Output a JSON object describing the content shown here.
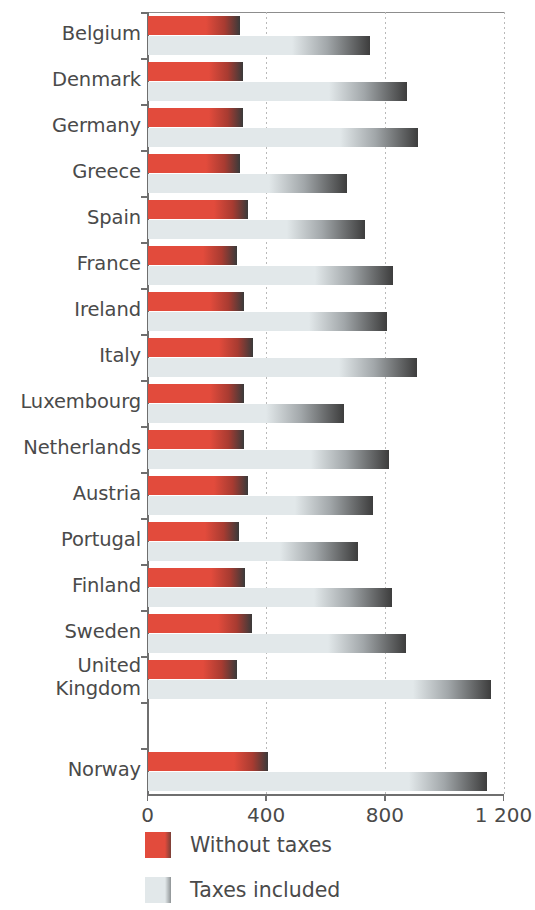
{
  "chart_data": {
    "type": "bar",
    "orientation": "horizontal",
    "title": "",
    "xlabel": "",
    "ylabel": "",
    "xlim": [
      0,
      1200
    ],
    "xticks": [
      0,
      400,
      800,
      1200
    ],
    "xtick_labels": [
      "0",
      "400",
      "800",
      "1 200"
    ],
    "grid": "vertical-dotted",
    "legend_position": "bottom-left",
    "categories": [
      "Belgium",
      "Denmark",
      "Germany",
      "Greece",
      "Spain",
      "France",
      "Ireland",
      "Italy",
      "Luxembourg",
      "Netherlands",
      "Austria",
      "Portugal",
      "Finland",
      "Sweden",
      "United\nKingdom",
      "",
      "Norway"
    ],
    "series": [
      {
        "name": "Without taxes",
        "color": "#e24b3c",
        "values": [
          311,
          321,
          321,
          311,
          338,
          301,
          324,
          354,
          324,
          324,
          338,
          308,
          328,
          351,
          301,
          null,
          406
        ]
      },
      {
        "name": "Taxes included",
        "color": "#e2e8ea",
        "values": [
          750,
          876,
          913,
          672,
          733,
          828,
          807,
          909,
          663,
          815,
          760,
          711,
          824,
          872,
          1159,
          null,
          1146
        ]
      }
    ]
  },
  "legend": {
    "items": [
      {
        "label": "Without taxes",
        "swatch": "red"
      },
      {
        "label": "Taxes included",
        "swatch": "grey"
      }
    ]
  }
}
